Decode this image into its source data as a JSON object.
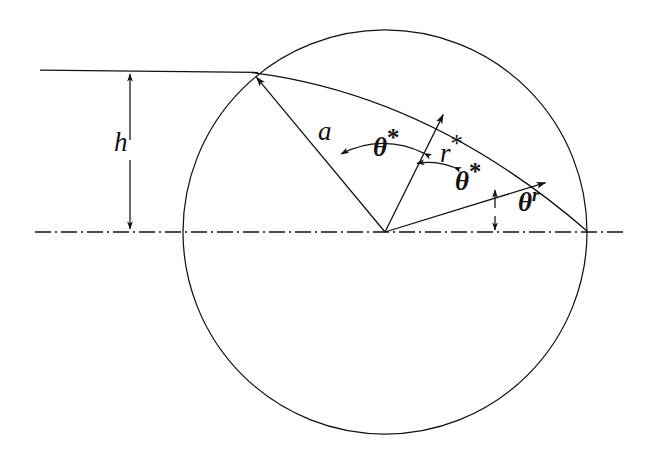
{
  "figure": {
    "background_color": "#ffffff",
    "stroke_color": "#111111"
  },
  "labels": {
    "h": "h",
    "a": "a",
    "theta_star_1": "θ",
    "theta_star_1_sup": "*",
    "r_star": "r",
    "r_star_sup": "*",
    "theta_star_2": "θ",
    "theta_star_2_sup": "*",
    "theta_r": "θ",
    "theta_r_sup": "r"
  },
  "geometry": {
    "circle": {
      "cx": 385,
      "cy": 232,
      "r": 202
    },
    "axis_line": {
      "x1": 35,
      "y1": 232,
      "x2": 625,
      "y2": 232,
      "style": "dash-dot"
    },
    "top_line": {
      "x1": 40,
      "y1": 70,
      "x2": 258,
      "y2": 72,
      "style": "solid"
    },
    "h_dimension": {
      "x": 130,
      "y_top": 72,
      "y_bottom": 231
    },
    "chord_arc": {
      "from_x": 253,
      "from_y": 73,
      "to_x": 587,
      "to_y": 232
    },
    "rays": [
      {
        "name": "ray-a",
        "angle_deg": 130.3,
        "length": 205,
        "arrow": "end"
      },
      {
        "name": "ray-r-star",
        "angle_deg": 63.6,
        "length": 131,
        "arrow": "end"
      },
      {
        "name": "ray-theta-r",
        "angle_deg": 17.1,
        "length": 168,
        "arrow": "end"
      }
    ],
    "angle_arcs": [
      {
        "name": "arc-theta-star-1",
        "radius": 88,
        "from_deg": 63.6,
        "to_deg": 130.3
      },
      {
        "name": "arc-theta-star-2",
        "radius": 72,
        "from_deg": 17.1,
        "to_deg": 63.6
      }
    ],
    "theta_r_measure": {
      "x": 495,
      "y_top": 191,
      "y_bottom": 231
    }
  }
}
